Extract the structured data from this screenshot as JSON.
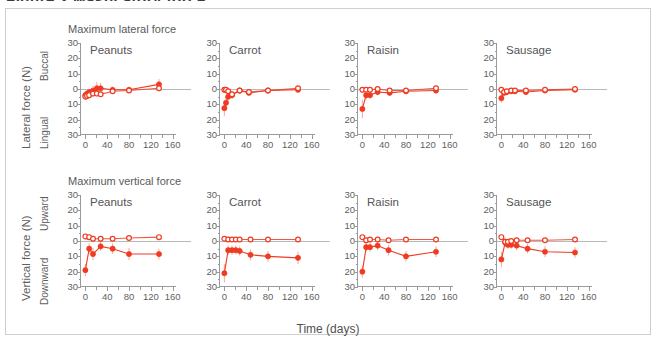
{
  "figure": {
    "caption_clipped": "Figure 2  Masticatory force",
    "frame_color": "#cfcfcf",
    "accent_color": "#ee3b22",
    "axis_color": "#9a9a9a",
    "xaxis_title": "Time (days)",
    "row_titles": {
      "lateral": "Maximum lateral force",
      "vertical": "Maximum vertical force"
    },
    "axis_titles": {
      "lateral": "Lateral force (N)",
      "vertical": "Vertical force (N)",
      "lateral_pos": "Buccal",
      "lateral_neg": "Lingual",
      "vertical_pos": "Upward",
      "vertical_neg": "Downward"
    },
    "yticks": [
      "30",
      "20",
      "10",
      "0",
      "10",
      "20",
      "30"
    ],
    "xticks": [
      "0",
      "40",
      "80",
      "120",
      "160"
    ],
    "foods": [
      "Peanuts",
      "Carrot",
      "Raisin",
      "Sausage"
    ],
    "legend": {
      "filled": "filled-circle",
      "open": "open-circle"
    }
  },
  "chart_data": [
    {
      "id": "lateral-peanuts",
      "type": "line",
      "title": "Peanuts",
      "row": "Maximum lateral force",
      "xlabel": "Time (days)",
      "ylabel": "Lateral force (N)",
      "xlim": [
        -8,
        168
      ],
      "ylim": [
        -30,
        30
      ],
      "ytick_labels": [
        "30",
        "20",
        "10",
        "0",
        "10",
        "20",
        "30"
      ],
      "xtick_labels": [
        "0",
        "40",
        "80",
        "120",
        "160"
      ],
      "grid": false,
      "legend_position": "none",
      "series": [
        {
          "name": "filled-circle",
          "marker": "filled",
          "x": [
            0,
            3,
            7,
            14,
            21,
            28,
            50,
            80,
            135
          ],
          "y": [
            -4.0,
            -3.0,
            -2.0,
            -1.0,
            0.5,
            0.5,
            -0.5,
            -0.5,
            3.0
          ],
          "err": [
            2.5,
            2.0,
            2.0,
            3.0,
            4.0,
            3.5,
            2.0,
            2.0,
            3.5
          ]
        },
        {
          "name": "open-circle",
          "marker": "open",
          "x": [
            0,
            3,
            7,
            14,
            21,
            28,
            50,
            80,
            135
          ],
          "y": [
            -5.0,
            -4.5,
            -4.0,
            -3.0,
            -3.0,
            -3.5,
            -1.5,
            -1.0,
            0.5
          ],
          "err": [
            2.0,
            2.0,
            2.0,
            2.0,
            2.0,
            2.0,
            1.5,
            1.5,
            2.0
          ]
        }
      ]
    },
    {
      "id": "lateral-carrot",
      "type": "line",
      "title": "Carrot",
      "row": "Maximum lateral force",
      "xlabel": "Time (days)",
      "ylabel": "Lateral force (N)",
      "xlim": [
        -8,
        168
      ],
      "ylim": [
        -30,
        30
      ],
      "series": [
        {
          "name": "filled-circle",
          "marker": "filled",
          "x": [
            0,
            3,
            7,
            14,
            28,
            45,
            80,
            135
          ],
          "y": [
            -12.5,
            -9.0,
            -5.0,
            -4.0,
            -1.0,
            -2.5,
            -1.0,
            -0.5
          ],
          "err": [
            5.0,
            4.0,
            3.0,
            2.5,
            2.0,
            2.0,
            2.0,
            2.0
          ]
        },
        {
          "name": "open-circle",
          "marker": "open",
          "x": [
            0,
            3,
            7,
            14,
            28,
            45,
            80,
            135
          ],
          "y": [
            -0.5,
            -0.5,
            -1.5,
            -3.5,
            -1.0,
            -2.0,
            -1.0,
            0.5
          ],
          "err": [
            2.0,
            2.0,
            2.0,
            2.0,
            1.5,
            1.5,
            1.5,
            1.5
          ]
        }
      ]
    },
    {
      "id": "lateral-raisin",
      "type": "line",
      "title": "Raisin",
      "row": "Maximum lateral force",
      "xlabel": "Time (days)",
      "ylabel": "Lateral force (N)",
      "xlim": [
        -8,
        168
      ],
      "ylim": [
        -30,
        30
      ],
      "series": [
        {
          "name": "filled-circle",
          "marker": "filled",
          "x": [
            0,
            7,
            14,
            28,
            50,
            80,
            135
          ],
          "y": [
            -13.0,
            -4.0,
            -4.0,
            -2.0,
            -2.5,
            -1.5,
            -1.0
          ],
          "err": [
            6.0,
            3.0,
            2.5,
            2.0,
            2.0,
            2.0,
            2.0
          ]
        },
        {
          "name": "open-circle",
          "marker": "open",
          "x": [
            0,
            7,
            14,
            28,
            50,
            80,
            135
          ],
          "y": [
            -0.5,
            -0.5,
            -0.5,
            0.0,
            -1.0,
            -1.0,
            0.5
          ],
          "err": [
            1.5,
            1.5,
            1.5,
            1.5,
            1.5,
            1.5,
            1.5
          ]
        }
      ]
    },
    {
      "id": "lateral-sausage",
      "type": "line",
      "title": "Sausage",
      "row": "Maximum lateral force",
      "xlabel": "Time (days)",
      "ylabel": "Lateral force (N)",
      "xlim": [
        -8,
        168
      ],
      "ylim": [
        -30,
        30
      ],
      "series": [
        {
          "name": "filled-circle",
          "marker": "filled",
          "x": [
            0,
            5,
            10,
            18,
            25,
            45,
            80,
            135
          ],
          "y": [
            -6.0,
            -2.5,
            -2.0,
            -1.5,
            -1.5,
            -2.0,
            -1.0,
            -0.5
          ],
          "err": [
            3.0,
            2.0,
            2.0,
            1.5,
            1.5,
            2.0,
            1.5,
            1.5
          ]
        },
        {
          "name": "open-circle",
          "marker": "open",
          "x": [
            0,
            5,
            10,
            18,
            25,
            45,
            80,
            135
          ],
          "y": [
            -0.5,
            -2.0,
            -1.5,
            -1.0,
            -1.0,
            -1.0,
            -0.5,
            0.0
          ],
          "err": [
            1.5,
            1.5,
            1.5,
            1.5,
            1.5,
            1.5,
            1.5,
            1.5
          ]
        }
      ]
    },
    {
      "id": "vertical-peanuts",
      "type": "line",
      "title": "Peanuts",
      "row": "Maximum vertical force",
      "xlabel": "Time (days)",
      "ylabel": "Vertical force (N)",
      "xlim": [
        -8,
        168
      ],
      "ylim": [
        -30,
        30
      ],
      "series": [
        {
          "name": "filled-circle",
          "marker": "filled",
          "x": [
            0,
            7,
            14,
            28,
            50,
            80,
            135
          ],
          "y": [
            -19.0,
            -5.0,
            -8.5,
            -3.5,
            -5.0,
            -8.5,
            -8.5
          ],
          "err": [
            4.0,
            3.5,
            4.0,
            3.0,
            3.5,
            4.0,
            3.5
          ]
        },
        {
          "name": "open-circle",
          "marker": "open",
          "x": [
            0,
            7,
            14,
            28,
            50,
            80,
            135
          ],
          "y": [
            3.0,
            2.5,
            1.5,
            1.5,
            1.5,
            2.0,
            2.5
          ],
          "err": [
            2.0,
            2.0,
            2.0,
            1.5,
            1.5,
            1.5,
            1.5
          ]
        }
      ]
    },
    {
      "id": "vertical-carrot",
      "type": "line",
      "title": "Carrot",
      "row": "Maximum vertical force",
      "xlabel": "Time (days)",
      "ylabel": "Vertical force (N)",
      "xlim": [
        -8,
        168
      ],
      "ylim": [
        -30,
        30
      ],
      "series": [
        {
          "name": "filled-circle",
          "marker": "filled",
          "x": [
            0,
            7,
            14,
            21,
            28,
            48,
            80,
            135
          ],
          "y": [
            -21.0,
            -6.0,
            -6.0,
            -6.0,
            -6.5,
            -9.0,
            -10.0,
            -11.0
          ],
          "err": [
            6.0,
            3.0,
            3.0,
            3.0,
            3.0,
            3.5,
            3.5,
            4.0
          ]
        },
        {
          "name": "open-circle",
          "marker": "open",
          "x": [
            0,
            7,
            14,
            21,
            28,
            48,
            80,
            135
          ],
          "y": [
            1.5,
            1.0,
            1.0,
            1.0,
            1.0,
            1.0,
            1.0,
            1.0
          ],
          "err": [
            1.5,
            1.5,
            1.5,
            1.5,
            1.5,
            1.5,
            1.5,
            1.5
          ]
        }
      ]
    },
    {
      "id": "vertical-raisin",
      "type": "line",
      "title": "Raisin",
      "row": "Maximum vertical force",
      "xlabel": "Time (days)",
      "ylabel": "Vertical force (N)",
      "xlim": [
        -8,
        168
      ],
      "ylim": [
        -30,
        30
      ],
      "series": [
        {
          "name": "filled-circle",
          "marker": "filled",
          "x": [
            0,
            7,
            14,
            28,
            48,
            80,
            135
          ],
          "y": [
            -20.0,
            -4.0,
            -4.0,
            -3.0,
            -6.0,
            -10.0,
            -7.0
          ],
          "err": [
            4.0,
            3.0,
            3.0,
            3.0,
            3.5,
            3.5,
            3.5
          ]
        },
        {
          "name": "open-circle",
          "marker": "open",
          "x": [
            0,
            7,
            14,
            28,
            48,
            80,
            135
          ],
          "y": [
            2.5,
            0.5,
            1.0,
            1.0,
            0.5,
            1.0,
            1.0
          ],
          "err": [
            1.5,
            1.5,
            1.5,
            1.5,
            1.5,
            1.5,
            1.5
          ]
        }
      ]
    },
    {
      "id": "vertical-sausage",
      "type": "line",
      "title": "Sausage",
      "row": "Maximum vertical force",
      "xlabel": "Time (days)",
      "ylabel": "Vertical force (N)",
      "xlim": [
        -8,
        168
      ],
      "ylim": [
        -30,
        30
      ],
      "series": [
        {
          "name": "filled-circle",
          "marker": "filled",
          "x": [
            0,
            7,
            12,
            18,
            28,
            48,
            80,
            135
          ],
          "y": [
            -12.0,
            -1.0,
            -2.5,
            -2.5,
            -3.0,
            -5.0,
            -7.0,
            -7.5
          ],
          "err": [
            5.0,
            3.0,
            2.5,
            2.5,
            3.0,
            3.0,
            3.5,
            3.5
          ]
        },
        {
          "name": "open-circle",
          "marker": "open",
          "x": [
            0,
            7,
            12,
            18,
            28,
            48,
            80,
            135
          ],
          "y": [
            2.5,
            -0.5,
            -0.5,
            0.0,
            0.5,
            0.5,
            0.5,
            1.0
          ],
          "err": [
            1.5,
            1.5,
            1.5,
            1.5,
            1.5,
            1.5,
            1.5,
            1.5
          ]
        }
      ]
    }
  ]
}
